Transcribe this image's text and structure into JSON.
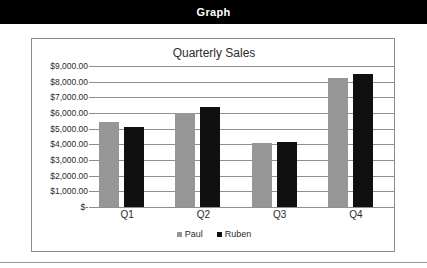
{
  "header": {
    "title": "Graph"
  },
  "chart_data": {
    "type": "bar",
    "title": "Quarterly Sales",
    "xlabel": "",
    "ylabel": "",
    "categories": [
      "Q1",
      "Q2",
      "Q3",
      "Q4"
    ],
    "series": [
      {
        "name": "Paul",
        "color": "#969696",
        "values": [
          5450,
          6000,
          4100,
          8250
        ]
      },
      {
        "name": "Ruben",
        "color": "#101010",
        "values": [
          5100,
          6400,
          4150,
          8500
        ]
      }
    ],
    "ylim": [
      0,
      9000
    ],
    "ytick_values": [
      9000,
      8000,
      7000,
      6000,
      5000,
      4000,
      3000,
      2000,
      1000,
      0
    ],
    "ytick_labels": [
      "$9,000.00",
      "$8,000.00",
      "$7,000.00",
      "$6,000.00",
      "$5,000.00",
      "$4,000.00",
      "$3,000.00",
      "$2,000.00",
      "$1,000.00",
      "$-"
    ],
    "grid": true,
    "legend_position": "bottom"
  }
}
